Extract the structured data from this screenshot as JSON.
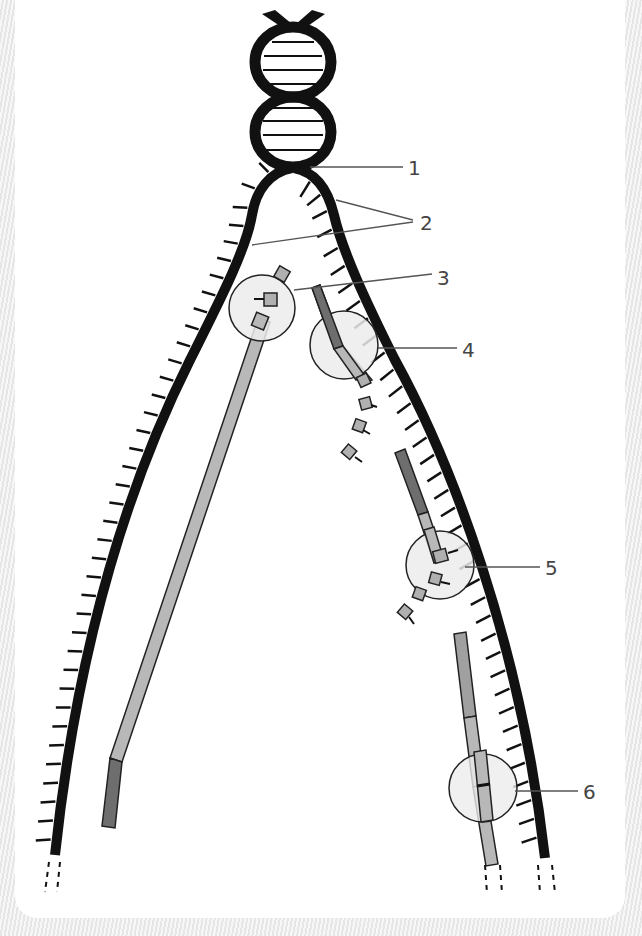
{
  "figure": {
    "type": "dna-replication-fork-diagram",
    "labels": [
      {
        "id": "1",
        "text": "1"
      },
      {
        "id": "2",
        "text": "2"
      },
      {
        "id": "3",
        "text": "3"
      },
      {
        "id": "4",
        "text": "4"
      },
      {
        "id": "5",
        "text": "5"
      },
      {
        "id": "6",
        "text": "6"
      }
    ]
  },
  "colors": {
    "strand": "#111111",
    "primer_dark": "#6e6e6e",
    "new_strand_light": "#b8b8b8",
    "enzyme_circle": "#ececec",
    "label_text": "#444444",
    "leader_line": "#555555"
  }
}
